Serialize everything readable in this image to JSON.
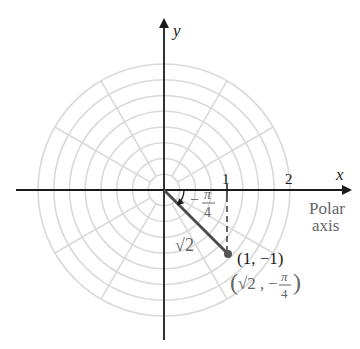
{
  "diagram": {
    "type": "polar-coordinate-plot",
    "origin_px": [
      164,
      190
    ],
    "unit_px": 63,
    "grid": {
      "circle_count": 8,
      "circle_step_units": 0.25,
      "spoke_angle_step_deg": 30,
      "color": "#d9d9d9"
    },
    "axes": {
      "x_label": "x",
      "y_label": "y",
      "polar_axis_label_line1": "Polar",
      "polar_axis_label_line2": "axis",
      "ticks": [
        {
          "value": 1,
          "label": "1"
        },
        {
          "value": 2,
          "label": "2"
        }
      ]
    },
    "point": {
      "cartesian_label": "(1, −1)",
      "polar_r": "√2",
      "polar_theta_num": "π",
      "polar_theta_den": "4",
      "polar_theta_sign": "−",
      "polar_label_open": "(√2, −",
      "polar_label_close": ")",
      "x": 1,
      "y": -1
    },
    "radius_label": "√2",
    "angle_label": {
      "sign": "−",
      "numerator": "π",
      "denominator": "4"
    },
    "colors": {
      "axis": "#1a1a1a",
      "segment": "#4a4a4a",
      "point": "#555555",
      "label_grey": "#666666"
    }
  }
}
